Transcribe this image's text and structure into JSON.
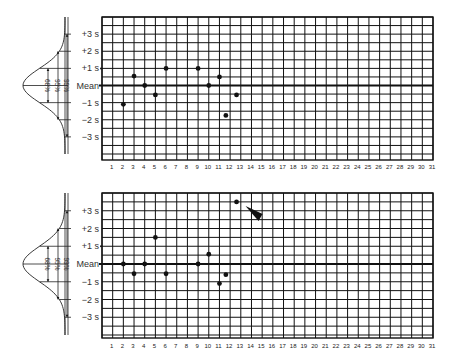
{
  "chart_data": [
    {
      "type": "scatter",
      "title": "Levey-Jennings control chart (upper)",
      "xlabel": "",
      "ylabel": "",
      "x_ticks": [
        1,
        2,
        3,
        4,
        5,
        6,
        7,
        8,
        9,
        10,
        11,
        12,
        13,
        14,
        15,
        16,
        17,
        18,
        19,
        20,
        21,
        22,
        23,
        24,
        25,
        26,
        27,
        28,
        29,
        30,
        31
      ],
      "y_tick_labels": [
        "+3 s",
        "+2 s",
        "+1 s",
        "Mean",
        "−1 s",
        "−2 s",
        "−3 s"
      ],
      "y_unit": "standard deviations from mean",
      "ylim": [
        -4.5,
        4
      ],
      "xlim": [
        0,
        31
      ],
      "grid": true,
      "distribution_labels": [
        "68%",
        "95%",
        "99%"
      ],
      "points": [
        {
          "x": 2,
          "y": -1.1
        },
        {
          "x": 3,
          "y": 0.55
        },
        {
          "x": 4,
          "y": 0.0
        },
        {
          "x": 5,
          "y": -0.55
        },
        {
          "x": 6,
          "y": 1.0
        },
        {
          "x": 9,
          "y": 1.0
        },
        {
          "x": 10,
          "y": 0.0
        },
        {
          "x": 11,
          "y": 0.5
        },
        {
          "x": 11.6,
          "y": -1.75
        },
        {
          "x": 12.6,
          "y": -0.55
        }
      ]
    },
    {
      "type": "scatter",
      "title": "Levey-Jennings control chart (lower)",
      "xlabel": "",
      "ylabel": "",
      "x_ticks": [
        1,
        2,
        3,
        4,
        5,
        6,
        7,
        8,
        9,
        10,
        11,
        12,
        13,
        14,
        15,
        16,
        17,
        18,
        19,
        20,
        21,
        22,
        23,
        24,
        25,
        26,
        27,
        28,
        29,
        30,
        31
      ],
      "y_tick_labels": [
        "+3 s",
        "+2 s",
        "+1 s",
        "Mean",
        "−1 s",
        "−2 s",
        "−3 s"
      ],
      "y_unit": "standard deviations from mean",
      "ylim": [
        -4.5,
        4
      ],
      "xlim": [
        0,
        31
      ],
      "grid": true,
      "distribution_labels": [
        "68%",
        "95%",
        "99%"
      ],
      "points": [
        {
          "x": 2,
          "y": 0.0
        },
        {
          "x": 3,
          "y": -0.55
        },
        {
          "x": 4,
          "y": 0.0
        },
        {
          "x": 5,
          "y": 1.5
        },
        {
          "x": 6,
          "y": -0.55
        },
        {
          "x": 9,
          "y": 0.0
        },
        {
          "x": 10,
          "y": 0.55
        },
        {
          "x": 11,
          "y": -1.1
        },
        {
          "x": 11.6,
          "y": -0.6
        },
        {
          "x": 12.6,
          "y": 3.5
        }
      ],
      "annotation": {
        "type": "arrowhead",
        "points_to": {
          "x": 12.6,
          "y": 3.5
        },
        "meaning": "out-of-control point beyond +3 s"
      }
    }
  ],
  "charts_layout": [
    {
      "top": 17,
      "bottom": 160,
      "mean_y": 85.5,
      "label_y": 169
    },
    {
      "top": 193,
      "bottom": 338,
      "mean_y": 264,
      "label_y": 348
    }
  ],
  "style": {
    "ink": "#111111",
    "background": "#ffffff"
  }
}
